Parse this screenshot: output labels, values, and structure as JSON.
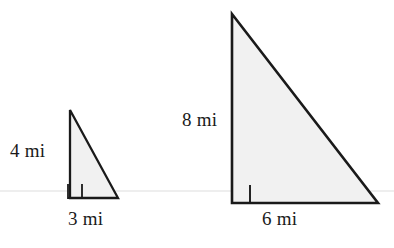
{
  "figure": {
    "unit": "mi",
    "colors": {
      "background": "#ffffff",
      "triangle_fill": "#f1f1f1",
      "triangle_stroke": "#1a1a1a",
      "guide_line": "#e8e8e8",
      "label_text": "#1a1a1a"
    },
    "guide_line": {
      "name": "horizontal-guide-line",
      "y": 191
    }
  },
  "shapes": [
    {
      "id": "small-triangle",
      "name": "small-right-triangle",
      "kind": "right-triangle",
      "points": "70,110 70,198 118,198",
      "right_angle_marker": "82,184 82,198 68,198 68,184",
      "height_label": "4 mi",
      "base_label": "3 mi",
      "height_value": 4,
      "base_value": 3
    },
    {
      "id": "large-triangle",
      "name": "large-right-triangle",
      "kind": "right-triangle",
      "points": "232,14 232,203 378,203",
      "right_angle_marker": "250,185 250,203 232,203 232,185",
      "height_label": "8 mi",
      "base_label": "6 mi",
      "height_value": 8,
      "base_value": 6
    }
  ],
  "labels": {
    "small_height": "4 mi",
    "small_base": "3 mi",
    "large_height": "8 mi",
    "large_base": "6 mi"
  }
}
